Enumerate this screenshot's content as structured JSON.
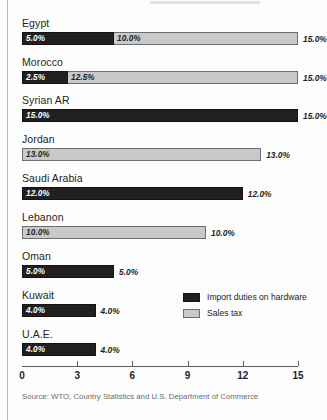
{
  "figure": {
    "source_note": "Source: WTO, Country Statistics and U.S. Department of Commerce"
  },
  "legend": {
    "position": "inside-right",
    "items": [
      {
        "label": "Import duties on hardware",
        "color": "#221f20",
        "key": "duties"
      },
      {
        "label": "Sales tax",
        "color": "#c9c9c9",
        "key": "sales_tax"
      }
    ]
  },
  "axis": {
    "ticks": [
      "0",
      "3",
      "6",
      "9",
      "12",
      "15"
    ],
    "min": 0,
    "max": 15
  },
  "chart_data": {
    "type": "bar",
    "orientation": "horizontal",
    "stacked": true,
    "title": "",
    "xlabel": "",
    "ylabel": "",
    "xlim": [
      0,
      15
    ],
    "grid": false,
    "legend_position": "inside-right",
    "categories": [
      "Egypt",
      "Morocco",
      "Syrian AR",
      "Jordan",
      "Saudi Arabia",
      "Lebanon",
      "Oman",
      "Kuwait",
      "U.A.E."
    ],
    "series": [
      {
        "name": "Import duties on hardware",
        "color": "#221f20",
        "values": [
          5.0,
          2.5,
          15.0,
          0,
          12.0,
          0,
          5.0,
          4.0,
          4.0
        ]
      },
      {
        "name": "Sales tax",
        "color": "#c9c9c9",
        "values": [
          10.0,
          12.5,
          0,
          13.0,
          0,
          10.0,
          0,
          0,
          0
        ]
      }
    ],
    "totals": [
      15.0,
      15.0,
      15.0,
      13.0,
      12.0,
      10.0,
      5.0,
      4.0,
      4.0
    ],
    "rows": [
      {
        "label": "Egypt",
        "segments": [
          {
            "key": "duties",
            "value": 5.0,
            "text": "5.0%"
          },
          {
            "key": "sales_tax",
            "value": 10.0,
            "text": "10.0%"
          }
        ],
        "total_text": "15.0%"
      },
      {
        "label": "Morocco",
        "segments": [
          {
            "key": "duties",
            "value": 2.5,
            "text": "2.5%"
          },
          {
            "key": "sales_tax",
            "value": 12.5,
            "text": "12.5%"
          }
        ],
        "total_text": "15.0%"
      },
      {
        "label": "Syrian AR",
        "segments": [
          {
            "key": "duties",
            "value": 15.0,
            "text": "15.0%"
          }
        ],
        "total_text": "15.0%"
      },
      {
        "label": "Jordan",
        "segments": [
          {
            "key": "sales_tax",
            "value": 13.0,
            "text": "13.0%"
          }
        ],
        "total_text": "13.0%"
      },
      {
        "label": "Saudi Arabia",
        "segments": [
          {
            "key": "duties",
            "value": 12.0,
            "text": "12.0%"
          }
        ],
        "total_text": "12.0%"
      },
      {
        "label": "Lebanon",
        "segments": [
          {
            "key": "sales_tax",
            "value": 10.0,
            "text": "10.0%"
          }
        ],
        "total_text": "10.0%"
      },
      {
        "label": "Oman",
        "segments": [
          {
            "key": "duties",
            "value": 5.0,
            "text": "5.0%"
          }
        ],
        "total_text": "5.0%"
      },
      {
        "label": "Kuwait",
        "segments": [
          {
            "key": "duties",
            "value": 4.0,
            "text": "4.0%"
          }
        ],
        "total_text": "4.0%"
      },
      {
        "label": "U.A.E.",
        "segments": [
          {
            "key": "duties",
            "value": 4.0,
            "text": "4.0%"
          }
        ],
        "total_text": "4.0%"
      }
    ]
  }
}
